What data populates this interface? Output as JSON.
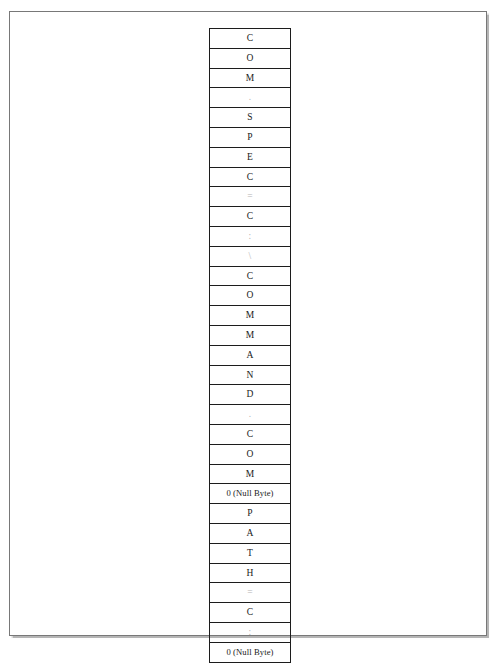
{
  "figure": {
    "kind": "byte-layout-column",
    "row_count": 32,
    "string_represented": "COM.SPEC=C:\\COMMAND.COM\u0000PATH=C:\u0000",
    "null_byte_label": "0 (Null Byte)",
    "colors": {
      "page_background": "#ffffff",
      "page_border": "#787878",
      "cell_border": "#1c1c1c",
      "text": "#1a1a1a",
      "faint_text": "#b4b4b4"
    }
  },
  "cells": [
    {
      "value": "C",
      "faint": false,
      "null": false
    },
    {
      "value": "O",
      "faint": false,
      "null": false
    },
    {
      "value": "M",
      "faint": false,
      "null": false
    },
    {
      "value": ".",
      "faint": true,
      "null": false
    },
    {
      "value": "S",
      "faint": false,
      "null": false
    },
    {
      "value": "P",
      "faint": false,
      "null": false
    },
    {
      "value": "E",
      "faint": false,
      "null": false
    },
    {
      "value": "C",
      "faint": false,
      "null": false
    },
    {
      "value": "=",
      "faint": true,
      "null": false
    },
    {
      "value": "C",
      "faint": false,
      "null": false
    },
    {
      "value": ":",
      "faint": true,
      "null": false
    },
    {
      "value": "\\",
      "faint": true,
      "null": false
    },
    {
      "value": "C",
      "faint": false,
      "null": false
    },
    {
      "value": "O",
      "faint": false,
      "null": false
    },
    {
      "value": "M",
      "faint": false,
      "null": false
    },
    {
      "value": "M",
      "faint": false,
      "null": false
    },
    {
      "value": "A",
      "faint": false,
      "null": false
    },
    {
      "value": "N",
      "faint": false,
      "null": false
    },
    {
      "value": "D",
      "faint": false,
      "null": false
    },
    {
      "value": ".",
      "faint": true,
      "null": false
    },
    {
      "value": "C",
      "faint": false,
      "null": false
    },
    {
      "value": "O",
      "faint": false,
      "null": false
    },
    {
      "value": "M",
      "faint": false,
      "null": false
    },
    {
      "value": "0 (Null Byte)",
      "faint": false,
      "null": true
    },
    {
      "value": "P",
      "faint": false,
      "null": false
    },
    {
      "value": "A",
      "faint": false,
      "null": false
    },
    {
      "value": "T",
      "faint": false,
      "null": false
    },
    {
      "value": "H",
      "faint": false,
      "null": false
    },
    {
      "value": "=",
      "faint": true,
      "null": false
    },
    {
      "value": "C",
      "faint": false,
      "null": false
    },
    {
      "value": ":",
      "faint": true,
      "null": false
    },
    {
      "value": "0 (Null Byte)",
      "faint": false,
      "null": true
    }
  ]
}
